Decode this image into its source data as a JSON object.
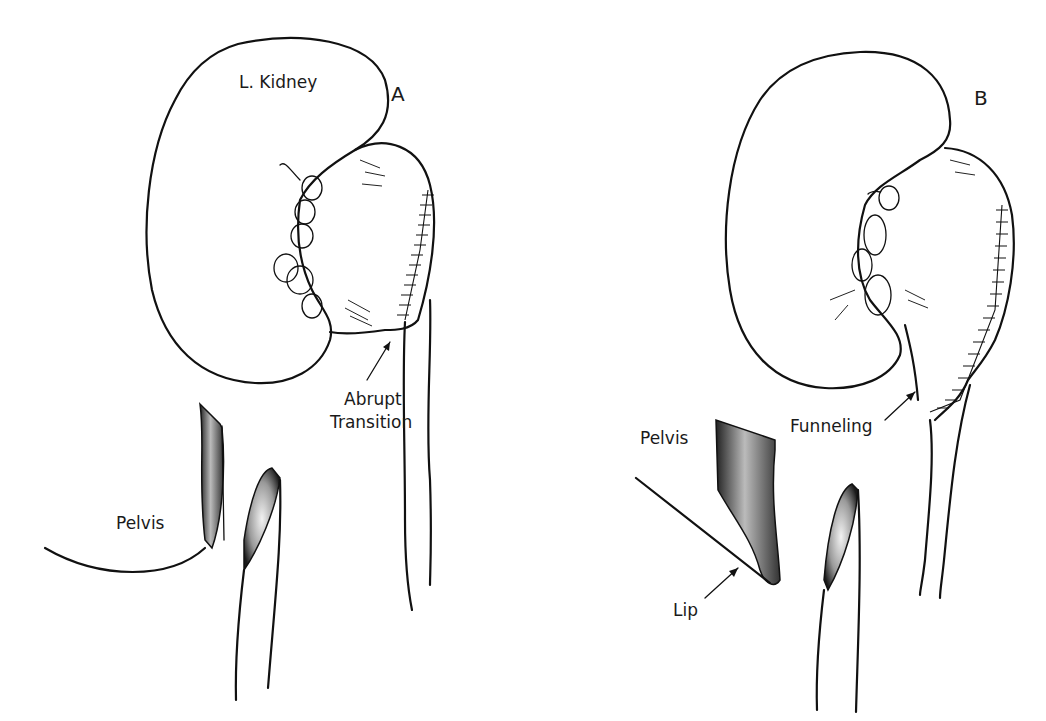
{
  "figure": {
    "panels": [
      {
        "id": "A",
        "letter": "A",
        "labels": {
          "kidney": "L. Kidney",
          "transition_line1": "Abrupt",
          "transition_line2": "Transition",
          "pelvis": "Pelvis"
        }
      },
      {
        "id": "B",
        "letter": "B",
        "labels": {
          "funneling": "Funneling",
          "pelvis": "Pelvis",
          "lip": "Lip"
        }
      }
    ],
    "colors": {
      "ink": "#111111",
      "background": "#ffffff"
    }
  }
}
